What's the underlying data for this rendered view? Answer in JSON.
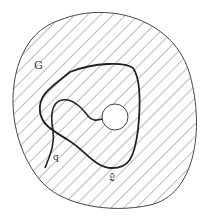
{
  "figure": {
    "labels": {
      "region": "G",
      "curve_end": "q",
      "loop": "𝔏"
    },
    "colors": {
      "stroke": "#222222",
      "hatch": "#555555",
      "background": "#ffffff"
    }
  }
}
